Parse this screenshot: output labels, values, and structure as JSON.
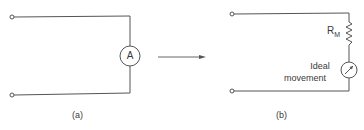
{
  "diagram": {
    "colors": {
      "wire": "#555555",
      "text": "#3a3a3a",
      "background": "#ffffff"
    },
    "panel_a": {
      "caption": "(a)",
      "meter_symbol": "A",
      "meter_type": "ammeter"
    },
    "arrow": {
      "direction": "right"
    },
    "panel_b": {
      "caption": "(b)",
      "resistor_label_main": "R",
      "resistor_label_sub": "M",
      "movement_label_line1": "Ideal",
      "movement_label_line2": "movement",
      "meter_type": "ideal-movement-meter"
    }
  }
}
